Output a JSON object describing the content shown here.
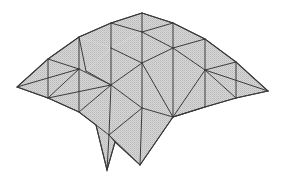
{
  "diagram": {
    "title": "",
    "type": "triangulated-surface-mesh",
    "colors": {
      "fill": "#d2d2d2",
      "hatch": "#b8b8b8",
      "edge": "#3a3a3a",
      "background": "#ffffff"
    },
    "vertices": {
      "T": [
        142,
        13
      ],
      "A": [
        111,
        23
      ],
      "B": [
        173,
        23
      ],
      "C": [
        79,
        37
      ],
      "D": [
        142,
        32
      ],
      "E": [
        205,
        39
      ],
      "F": [
        48,
        59
      ],
      "G": [
        111,
        48
      ],
      "H": [
        173,
        48
      ],
      "I": [
        236,
        62
      ],
      "J": [
        17,
        87
      ],
      "K": [
        79,
        69
      ],
      "L": [
        86,
        71
      ],
      "M": [
        142,
        63
      ],
      "N": [
        205,
        70
      ],
      "O": [
        268,
        91
      ],
      "P": [
        111,
        85
      ],
      "Q": [
        48,
        98
      ],
      "R": [
        236,
        98
      ],
      "S": [
        79,
        112
      ],
      "U": [
        142,
        108
      ],
      "V": [
        205,
        107
      ],
      "W": [
        173,
        117
      ],
      "X": [
        96,
        125
      ],
      "Y": [
        109,
        135
      ],
      "Z": [
        115,
        142
      ],
      "SP": [
        107,
        170
      ],
      "BT": [
        140,
        165
      ]
    },
    "outline": [
      "J",
      "F",
      "C",
      "A",
      "T",
      "B",
      "E",
      "I",
      "O",
      "R",
      "V",
      "W",
      "BT",
      "Z",
      "SP",
      "X",
      "S",
      "Q",
      "J"
    ],
    "edges": [
      [
        "J",
        "F"
      ],
      [
        "F",
        "C"
      ],
      [
        "C",
        "A"
      ],
      [
        "A",
        "T"
      ],
      [
        "T",
        "B"
      ],
      [
        "B",
        "E"
      ],
      [
        "E",
        "I"
      ],
      [
        "I",
        "O"
      ],
      [
        "O",
        "R"
      ],
      [
        "R",
        "V"
      ],
      [
        "V",
        "W"
      ],
      [
        "W",
        "BT"
      ],
      [
        "BT",
        "Y"
      ],
      [
        "Y",
        "Z"
      ],
      [
        "Z",
        "SP"
      ],
      [
        "SP",
        "X"
      ],
      [
        "X",
        "S"
      ],
      [
        "S",
        "Q"
      ],
      [
        "Q",
        "J"
      ],
      [
        "T",
        "D"
      ],
      [
        "A",
        "G"
      ],
      [
        "A",
        "D"
      ],
      [
        "D",
        "B"
      ],
      [
        "D",
        "M"
      ],
      [
        "D",
        "H"
      ],
      [
        "B",
        "H"
      ],
      [
        "H",
        "E"
      ],
      [
        "E",
        "N"
      ],
      [
        "H",
        "N"
      ],
      [
        "I",
        "N"
      ],
      [
        "I",
        "R"
      ],
      [
        "N",
        "O"
      ],
      [
        "N",
        "R"
      ],
      [
        "N",
        "V"
      ],
      [
        "N",
        "W"
      ],
      [
        "C",
        "L"
      ],
      [
        "C",
        "K"
      ],
      [
        "G",
        "P"
      ],
      [
        "G",
        "M"
      ],
      [
        "F",
        "K"
      ],
      [
        "F",
        "Q"
      ],
      [
        "J",
        "K"
      ],
      [
        "K",
        "P"
      ],
      [
        "L",
        "P"
      ],
      [
        "M",
        "H"
      ],
      [
        "M",
        "P"
      ],
      [
        "M",
        "U"
      ],
      [
        "M",
        "W"
      ],
      [
        "H",
        "W"
      ],
      [
        "P",
        "Q"
      ],
      [
        "P",
        "S"
      ],
      [
        "Q",
        "K"
      ],
      [
        "P",
        "U"
      ],
      [
        "P",
        "Y"
      ],
      [
        "S",
        "K"
      ],
      [
        "U",
        "W"
      ],
      [
        "U",
        "Y"
      ],
      [
        "U",
        "BT"
      ],
      [
        "X",
        "Y"
      ],
      [
        "Y",
        "SP"
      ],
      [
        "W",
        "V"
      ]
    ],
    "faces": [
      [
        "J",
        "F",
        "Q"
      ],
      [
        "F",
        "K",
        "Q"
      ],
      [
        "F",
        "C",
        "K"
      ],
      [
        "C",
        "L",
        "K"
      ],
      [
        "C",
        "A",
        "G"
      ],
      [
        "C",
        "G",
        "L"
      ],
      [
        "A",
        "T",
        "D"
      ],
      [
        "A",
        "D",
        "G"
      ],
      [
        "T",
        "B",
        "D"
      ],
      [
        "D",
        "B",
        "H"
      ],
      [
        "D",
        "H",
        "M"
      ],
      [
        "D",
        "M",
        "G"
      ],
      [
        "B",
        "E",
        "H"
      ],
      [
        "H",
        "E",
        "N"
      ],
      [
        "E",
        "I",
        "N"
      ],
      [
        "I",
        "O",
        "N"
      ],
      [
        "N",
        "O",
        "R"
      ],
      [
        "N",
        "R",
        "V"
      ],
      [
        "H",
        "N",
        "W"
      ],
      [
        "N",
        "V",
        "W"
      ],
      [
        "H",
        "W",
        "M"
      ],
      [
        "M",
        "W",
        "U"
      ],
      [
        "G",
        "M",
        "P"
      ],
      [
        "G",
        "P",
        "L"
      ],
      [
        "L",
        "P",
        "K"
      ],
      [
        "K",
        "P",
        "S"
      ],
      [
        "K",
        "S",
        "Q"
      ],
      [
        "M",
        "U",
        "P"
      ],
      [
        "P",
        "U",
        "Y"
      ],
      [
        "P",
        "Y",
        "S"
      ],
      [
        "S",
        "Y",
        "X"
      ],
      [
        "U",
        "W",
        "BT"
      ],
      [
        "U",
        "BT",
        "Y"
      ],
      [
        "Y",
        "BT",
        "Z"
      ],
      [
        "X",
        "Y",
        "Z",
        "SP"
      ]
    ]
  }
}
